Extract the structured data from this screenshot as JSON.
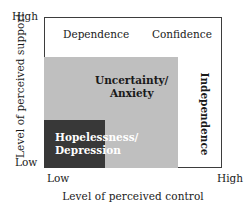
{
  "chart_data": {
    "type": "diagram",
    "title": "",
    "xlabel": "Level of perceived control",
    "ylabel": "Level of perceived support",
    "x_ticks": [
      "Low",
      "High"
    ],
    "y_ticks": [
      "Low",
      "High"
    ],
    "grid": false,
    "legend": "none",
    "regions": [
      {
        "name": "Dependence",
        "label": "Dependence",
        "quadrant": "top-left",
        "fill": "#ffffff",
        "text_color": "#1a1a1a",
        "bold": false
      },
      {
        "name": "Confidence",
        "label": "Confidence",
        "quadrant": "top-right",
        "fill": "#ffffff",
        "text_color": "#1a1a1a",
        "bold": false
      },
      {
        "name": "Uncertainty/Anxiety",
        "label_line1": "Uncertainty/",
        "label_line2": "Anxiety",
        "quadrant": "center-lower-left-block",
        "fill": "#bfbfbf",
        "text_color": "#1a1a1a",
        "bold": true
      },
      {
        "name": "Hopelessness/Depression",
        "label_line1": "Hopelessness/",
        "label_line2": "Depression",
        "quadrant": "bottom-left",
        "fill": "#383838",
        "text_color": "#ffffff",
        "bold": true
      },
      {
        "name": "Independence",
        "label": "Independence",
        "quadrant": "right-band-vertical",
        "fill": "#ffffff",
        "text_color": "#1a1a1a",
        "bold": true,
        "rotation": 90
      }
    ]
  },
  "axes": {
    "y_title": "Level of perceived support",
    "x_title": "Level of perceived control",
    "y_high": "High",
    "y_low": "Low",
    "x_low": "Low",
    "x_high": "High"
  },
  "labels": {
    "dependence": "Dependence",
    "confidence": "Confidence",
    "uncertainty_line1": "Uncertainty/",
    "uncertainty_line2": "Anxiety",
    "hopelessness_line1": "Hopelessness/",
    "hopelessness_line2": "Depression",
    "independence": "Independence"
  },
  "colors": {
    "gray_region": "#bfbfbf",
    "dark_region": "#383838",
    "frame": "#3d3d3d",
    "background": "#ffffff",
    "text": "#1a1a1a",
    "inverse_text": "#ffffff"
  }
}
